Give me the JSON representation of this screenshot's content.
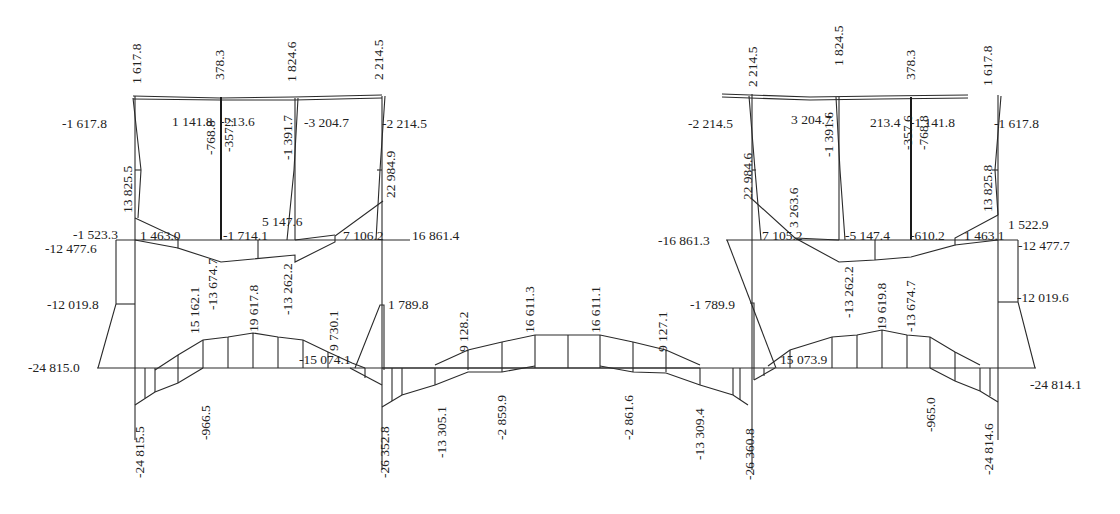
{
  "diagram": {
    "type": "structural internal force diagram (frame moment diagram)",
    "line_color": "#2a2a2a",
    "background": "#ffffff",
    "labels": [
      {
        "id": "l01",
        "text": "-1 617.8",
        "x": 62,
        "y": 128,
        "rot": 0
      },
      {
        "id": "l02",
        "text": "1 617.8",
        "x": 141,
        "y": 84,
        "rot": -90
      },
      {
        "id": "l03",
        "text": "1 141.8",
        "x": 172,
        "y": 126,
        "rot": 0
      },
      {
        "id": "l04",
        "text": "378.3",
        "x": 224,
        "y": 80,
        "rot": -90
      },
      {
        "id": "l05",
        "text": "-213.6",
        "x": 220,
        "y": 126,
        "rot": 0
      },
      {
        "id": "l06",
        "text": "1 824.6",
        "x": 296,
        "y": 82,
        "rot": -90
      },
      {
        "id": "l07",
        "text": "-3 204.7",
        "x": 304,
        "y": 127,
        "rot": 0
      },
      {
        "id": "l08",
        "text": "2 214.5",
        "x": 383,
        "y": 80,
        "rot": -90
      },
      {
        "id": "l09",
        "text": "-2 214.5",
        "x": 382,
        "y": 128,
        "rot": 0
      },
      {
        "id": "l10",
        "text": "-768.8",
        "x": 215,
        "y": 155,
        "rot": -90
      },
      {
        "id": "l11",
        "text": "-357.7",
        "x": 233,
        "y": 152,
        "rot": -90
      },
      {
        "id": "l12",
        "text": "-1 391.7",
        "x": 292,
        "y": 160,
        "rot": -90
      },
      {
        "id": "l13",
        "text": "13 825.5",
        "x": 132,
        "y": 213,
        "rot": -90
      },
      {
        "id": "l14",
        "text": "22 984.9",
        "x": 395,
        "y": 198,
        "rot": -90
      },
      {
        "id": "l15",
        "text": "5 147.6",
        "x": 262,
        "y": 226,
        "rot": 0
      },
      {
        "id": "l16",
        "text": "-1 523.3",
        "x": 73,
        "y": 239,
        "rot": 0
      },
      {
        "id": "l17",
        "text": "1 463.0",
        "x": 140,
        "y": 240,
        "rot": 0
      },
      {
        "id": "l18",
        "text": "-1 714.1",
        "x": 223,
        "y": 240,
        "rot": 0
      },
      {
        "id": "l19",
        "text": "7 106.2",
        "x": 343,
        "y": 240,
        "rot": 0
      },
      {
        "id": "l20",
        "text": "16 861.4",
        "x": 412,
        "y": 240,
        "rot": 0
      },
      {
        "id": "l21",
        "text": "-12 477.6",
        "x": 45,
        "y": 253,
        "rot": 0
      },
      {
        "id": "l22",
        "text": "-12 019.8",
        "x": 47,
        "y": 309,
        "rot": 0
      },
      {
        "id": "l23",
        "text": "15 162.1",
        "x": 199,
        "y": 334,
        "rot": -90
      },
      {
        "id": "l24",
        "text": "-13 674.7",
        "x": 217,
        "y": 310,
        "rot": -90
      },
      {
        "id": "l25",
        "text": "19 617.8",
        "x": 258,
        "y": 332,
        "rot": -90
      },
      {
        "id": "l26",
        "text": "-13 262.2",
        "x": 292,
        "y": 315,
        "rot": -90
      },
      {
        "id": "l27",
        "text": "9 730.1",
        "x": 338,
        "y": 351,
        "rot": -90
      },
      {
        "id": "l28",
        "text": "-15 074.1",
        "x": 299,
        "y": 364,
        "rot": 0
      },
      {
        "id": "l29",
        "text": "1 789.8",
        "x": 388,
        "y": 309,
        "rot": 0
      },
      {
        "id": "l30",
        "text": "-24 815.0",
        "x": 28,
        "y": 372,
        "rot": 0
      },
      {
        "id": "l31",
        "text": "-24 815.5",
        "x": 144,
        "y": 478,
        "rot": -90
      },
      {
        "id": "l32",
        "text": "-966.5",
        "x": 210,
        "y": 440,
        "rot": -90
      },
      {
        "id": "l33",
        "text": "-26 352.8",
        "x": 389,
        "y": 478,
        "rot": -90
      },
      {
        "id": "l34",
        "text": "-13 305.1",
        "x": 446,
        "y": 458,
        "rot": -90
      },
      {
        "id": "l35",
        "text": "9 128.2",
        "x": 468,
        "y": 352,
        "rot": -90
      },
      {
        "id": "l36",
        "text": "-2 859.9",
        "x": 506,
        "y": 440,
        "rot": -90
      },
      {
        "id": "l37",
        "text": "16 611.3",
        "x": 534,
        "y": 333,
        "rot": -90
      },
      {
        "id": "l38",
        "text": "16 611.1",
        "x": 600,
        "y": 333,
        "rot": -90
      },
      {
        "id": "l39",
        "text": "-2 861.6",
        "x": 633,
        "y": 440,
        "rot": -90
      },
      {
        "id": "l40",
        "text": "9 127.1",
        "x": 667,
        "y": 352,
        "rot": -90
      },
      {
        "id": "l41",
        "text": "-13 309.4",
        "x": 704,
        "y": 460,
        "rot": -90
      },
      {
        "id": "l42",
        "text": "-26 360.8",
        "x": 754,
        "y": 480,
        "rot": -90
      },
      {
        "id": "l43",
        "text": "-1 789.9",
        "x": 690,
        "y": 309,
        "rot": 0
      },
      {
        "id": "l44",
        "text": "-16 861.3",
        "x": 658,
        "y": 245,
        "rot": 0
      },
      {
        "id": "l45",
        "text": "15 073.9",
        "x": 780,
        "y": 364,
        "rot": 0
      },
      {
        "id": "l46",
        "text": "-13 262.2",
        "x": 853,
        "y": 318,
        "rot": -90
      },
      {
        "id": "l47",
        "text": "19 619.8",
        "x": 886,
        "y": 330,
        "rot": -90
      },
      {
        "id": "l48",
        "text": "-13 674.7",
        "x": 915,
        "y": 332,
        "rot": -90
      },
      {
        "id": "l49",
        "text": "-965.0",
        "x": 935,
        "y": 432,
        "rot": -90
      },
      {
        "id": "l50",
        "text": "-24 814.6",
        "x": 993,
        "y": 475,
        "rot": -90
      },
      {
        "id": "l51",
        "text": "-24 814.1",
        "x": 1030,
        "y": 389,
        "rot": 0
      },
      {
        "id": "l52",
        "text": "-12 019.6",
        "x": 1017,
        "y": 302,
        "rot": 0
      },
      {
        "id": "l53",
        "text": "-12 477.7",
        "x": 1018,
        "y": 250,
        "rot": 0
      },
      {
        "id": "l54",
        "text": "1 522.9",
        "x": 1008,
        "y": 229,
        "rot": 0
      },
      {
        "id": "l55",
        "text": "1 463.1",
        "x": 964,
        "y": 240,
        "rot": 0
      },
      {
        "id": "l56",
        "text": "-610.2",
        "x": 910,
        "y": 240,
        "rot": 0
      },
      {
        "id": "l57",
        "text": "-5 147.4",
        "x": 845,
        "y": 240,
        "rot": 0
      },
      {
        "id": "l58",
        "text": "7 105.2",
        "x": 762,
        "y": 240,
        "rot": 0
      },
      {
        "id": "l59",
        "text": "3 263.6",
        "x": 798,
        "y": 228,
        "rot": -90
      },
      {
        "id": "l60",
        "text": "22 984.6",
        "x": 752,
        "y": 200,
        "rot": -90
      },
      {
        "id": "l61",
        "text": "13 825.8",
        "x": 992,
        "y": 212,
        "rot": -90
      },
      {
        "id": "l62",
        "text": "-1 391.6",
        "x": 833,
        "y": 157,
        "rot": -90
      },
      {
        "id": "l63",
        "text": "-357.6",
        "x": 912,
        "y": 150,
        "rot": -90
      },
      {
        "id": "l64",
        "text": "-768.8",
        "x": 928,
        "y": 150,
        "rot": -90
      },
      {
        "id": "l65",
        "text": "-2 214.5",
        "x": 688,
        "y": 128,
        "rot": 0
      },
      {
        "id": "l66",
        "text": "2 214.5",
        "x": 757,
        "y": 87,
        "rot": -90
      },
      {
        "id": "l67",
        "text": "3 204.7",
        "x": 791,
        "y": 124,
        "rot": 0
      },
      {
        "id": "l68",
        "text": "1 824.5",
        "x": 843,
        "y": 66,
        "rot": -90
      },
      {
        "id": "l69",
        "text": "213.4",
        "x": 870,
        "y": 127,
        "rot": 0
      },
      {
        "id": "l70",
        "text": "378.3",
        "x": 915,
        "y": 80,
        "rot": -90
      },
      {
        "id": "l71",
        "text": "-1 141.8",
        "x": 910,
        "y": 127,
        "rot": 0
      },
      {
        "id": "l72",
        "text": "1 617.8",
        "x": 992,
        "y": 86,
        "rot": -90
      },
      {
        "id": "l73",
        "text": "-1 617.8",
        "x": 994,
        "y": 128,
        "rot": 0
      }
    ]
  }
}
